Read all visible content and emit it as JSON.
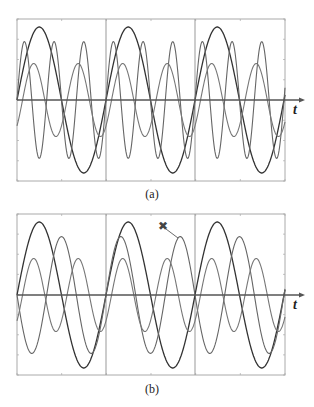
{
  "chart_data": [
    {
      "type": "line",
      "panel": "(a)",
      "xlabel": "t",
      "ylabel": "",
      "grid": false,
      "sections": 3,
      "section_dividers": true,
      "title": "",
      "series": [
        {
          "name": "fundamental",
          "amplitude": 1.0,
          "cycles_per_section": 1,
          "phase_deg": 0,
          "color": "#333333"
        },
        {
          "name": "third harmonic",
          "amplitude": 0.8,
          "cycles_per_section": 3,
          "phase_deg": 0,
          "color": "#666666"
        },
        {
          "name": "second harmonic",
          "amplitude": 0.5,
          "cycles_per_section": 2,
          "phase_deg": -45,
          "color": "#777777"
        }
      ],
      "ylim": [
        -1.1,
        1.1
      ]
    },
    {
      "type": "line",
      "panel": "(b)",
      "xlabel": "t",
      "ylabel": "",
      "grid": false,
      "sections": 3,
      "section_dividers": true,
      "title": "",
      "series": [
        {
          "name": "fundamental",
          "amplitude": 1.0,
          "cycles_per_section": 1,
          "phase_deg": 0,
          "color": "#333333"
        },
        {
          "name": "1.5x harmonic (non-periodic per section)",
          "amplitude": 0.8,
          "cycles_per_section": 1.5,
          "phase_deg": 180,
          "color": "#666666"
        },
        {
          "name": "second harmonic",
          "amplitude": 0.5,
          "cycles_per_section": 2,
          "phase_deg": -45,
          "color": "#777777"
        }
      ],
      "annotations": [
        {
          "type": "x-marker",
          "label": "✖",
          "target": "1.5x harmonic peak in second section"
        }
      ],
      "ylim": [
        -1.1,
        1.1
      ]
    }
  ],
  "figure": {
    "panels": [
      {
        "label": "(a)",
        "axis_label": "t",
        "frame": {
          "x": 17,
          "y": 19,
          "w": 268,
          "h": 162
        },
        "center_y": 100,
        "axis_end_x": 301,
        "dividers_x": [
          106,
          195
        ],
        "label_pos": {
          "x": 152,
          "y": 187
        },
        "t_pos": {
          "x": 293,
          "y": 102
        }
      },
      {
        "label": "(b)",
        "axis_label": "t",
        "frame": {
          "x": 17,
          "y": 214,
          "w": 268,
          "h": 161
        },
        "center_y": 295,
        "axis_end_x": 301,
        "dividers_x": [
          106,
          195
        ],
        "label_pos": {
          "x": 152,
          "y": 382
        },
        "t_pos": {
          "x": 293,
          "y": 297
        },
        "marker": {
          "symbol": "✖",
          "x": 163,
          "y": 226,
          "line_to": {
            "x": 178,
            "y": 238
          }
        }
      }
    ],
    "section_width_px": 89,
    "amplitude_px": 73,
    "colors": {
      "frame": "#aaaaaa",
      "axis": "#555555",
      "divider": "#999999",
      "marker": "#444444"
    }
  }
}
